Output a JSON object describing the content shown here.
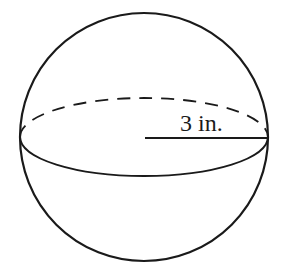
{
  "diagram": {
    "type": "sphere",
    "radius_label": "3 in.",
    "stroke_color": "#1a1a1a",
    "background": "#ffffff"
  }
}
